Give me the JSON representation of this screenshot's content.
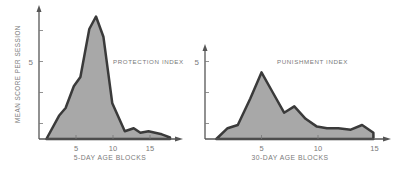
{
  "chart_data": [
    {
      "type": "area",
      "title": "PROTECTION INDEX",
      "xlabel": "5-DAY AGE BLOCKS",
      "ylabel": "MEAN SCORE PER SESSION",
      "xticks": [
        5,
        10,
        15
      ],
      "yticks": [
        {
          "value": 5,
          "label": "5"
        }
      ],
      "yminor_ticks": [
        1,
        3,
        5,
        7
      ],
      "xlim": [
        0,
        18.5
      ],
      "ylim": [
        0,
        8.5
      ],
      "grid": false,
      "x": [
        1.0,
        2.7,
        3.6,
        4.7,
        5.6,
        6.8,
        7.7,
        8.7,
        9.9,
        11.6,
        12.8,
        13.7,
        14.8,
        16.6,
        17.7
      ],
      "values": [
        0.0,
        1.5,
        2.0,
        3.4,
        4.0,
        7.1,
        7.9,
        6.6,
        2.3,
        0.5,
        0.7,
        0.4,
        0.5,
        0.3,
        0.1
      ]
    },
    {
      "type": "area",
      "title": "PUNISHMENT INDEX",
      "xlabel": "30-DAY AGE BLOCKS",
      "ylabel": "",
      "xticks": [
        5,
        10,
        15
      ],
      "yticks": [
        {
          "value": 5,
          "label": "5"
        }
      ],
      "yminor_ticks": [
        1,
        3,
        5
      ],
      "xlim": [
        0,
        16
      ],
      "ylim": [
        0,
        6.2
      ],
      "grid": false,
      "x": [
        1,
        2,
        2.9,
        4,
        5,
        6,
        7,
        7.9,
        8.9,
        9.9,
        10.8,
        11.8,
        12.9,
        13.9,
        14.9
      ],
      "values": [
        0.0,
        0.7,
        0.9,
        2.6,
        4.3,
        3.0,
        1.7,
        2.1,
        1.3,
        0.8,
        0.7,
        0.7,
        0.6,
        0.9,
        0.4
      ]
    }
  ],
  "labels": {
    "left_title": "PROTECTION INDEX",
    "right_title": "PUNISHMENT INDEX",
    "left_xlabel": "5-DAY AGE BLOCKS",
    "right_xlabel": "30-DAY AGE BLOCKS",
    "ylabel": "MEAN SCORE PER SESSION",
    "left_ytick": "5",
    "right_ytick": "5",
    "left_xticks": [
      "5",
      "10",
      "15"
    ],
    "right_xticks": [
      "5",
      "10",
      "15"
    ]
  },
  "colors": {
    "fill": "#a8a8a8",
    "line": "#3a3a3a",
    "axis": "#555555",
    "text": "#7a7a7a"
  }
}
